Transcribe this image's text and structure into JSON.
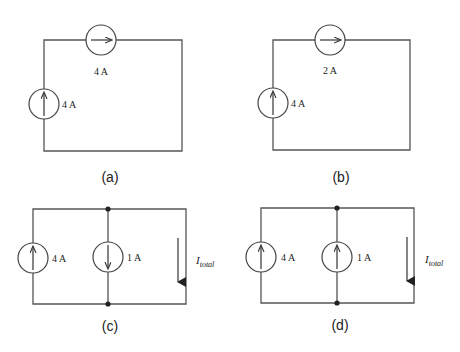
{
  "circuits": [
    {
      "caption": "(a)",
      "topology": "series-loop",
      "sources": [
        {
          "position": "left-branch",
          "direction": "up",
          "label": "4 A"
        },
        {
          "position": "top-branch",
          "direction": "right",
          "label": "4 A"
        }
      ]
    },
    {
      "caption": "(b)",
      "topology": "series-loop",
      "sources": [
        {
          "position": "left-branch",
          "direction": "up",
          "label": "4 A"
        },
        {
          "position": "top-branch",
          "direction": "right",
          "label": "2 A"
        }
      ]
    },
    {
      "caption": "(c)",
      "topology": "parallel",
      "sources": [
        {
          "position": "left-branch",
          "direction": "up",
          "label": "4 A"
        },
        {
          "position": "middle-branch",
          "direction": "down",
          "label": "1 A"
        }
      ],
      "current_arrow": {
        "direction": "down",
        "label_main": "I",
        "label_sub": "total"
      }
    },
    {
      "caption": "(d)",
      "topology": "parallel",
      "sources": [
        {
          "position": "left-branch",
          "direction": "up",
          "label": "4 A"
        },
        {
          "position": "middle-branch",
          "direction": "up",
          "label": "1 A"
        }
      ],
      "current_arrow": {
        "direction": "down",
        "label_main": "I",
        "label_sub": "total"
      }
    }
  ]
}
